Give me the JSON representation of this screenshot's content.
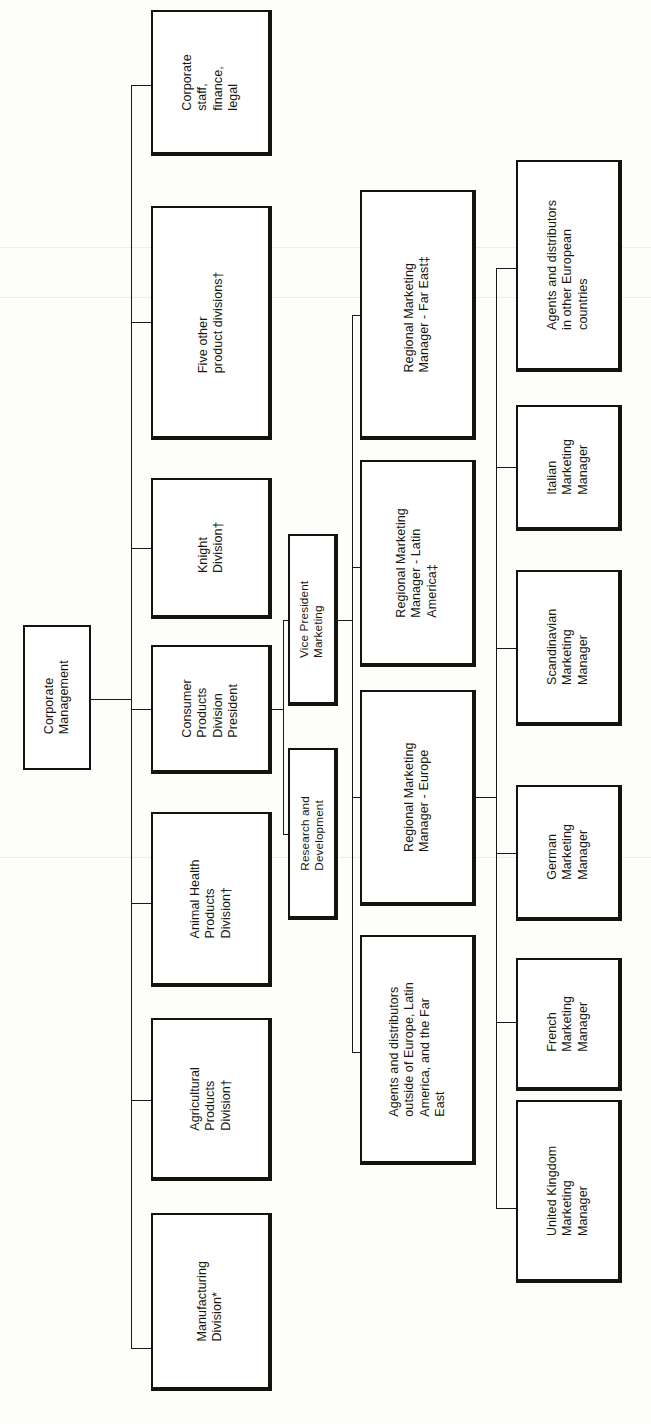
{
  "chart": {
    "orientation": "rotated-90-ccw",
    "line_color": "#1a1a14",
    "box_border_color": "#14140f",
    "box_fill_color": "#ffffff",
    "page_background": "#fdfdfb"
  },
  "nodes": {
    "corporate_management": "Corporate\nManagement",
    "corporate_staff": "Corporate\nstaff,\nfinance,\nlegal",
    "five_other_divisions": "Five other\nproduct divisions†",
    "knight_division": "Knight\nDivision†",
    "consumer_products_president": "Consumer\nProducts\nDivision\nPresident",
    "animal_health": "Animal Health\nProducts\nDivision†",
    "agricultural_products": "Agricultural\nProducts\nDivision†",
    "manufacturing_division": "Manufacturing\nDivision*",
    "vice_president_marketing": "Vice President\nMarketing",
    "research_and_development": "Research and\nDevelopment",
    "rmm_far_east": "Regional Marketing\nManager - Far East‡",
    "rmm_latin_america": "Regional Marketing\nManager - Latin\nAmerica‡",
    "rmm_europe": "Regional Marketing\nManager - Europe",
    "agents_outside": "Agents and distributors\noutside of Europe, Latin\nAmerica, and the Far\nEast",
    "agents_other_european": "Agents and distributors\nin other European\ncountries",
    "italian_manager": "Italian\nMarketing\nManager",
    "scandinavian_manager": "Scandinavian\nMarketing\nManager",
    "german_manager": "German\nMarketing\nManager",
    "french_manager": "French\nMarketing\nManager",
    "uk_manager": "United Kingdom\nMarketing\nManager"
  },
  "footnote_markers": {
    "asterisk": "*",
    "dagger": "†",
    "double_dagger": "‡"
  }
}
